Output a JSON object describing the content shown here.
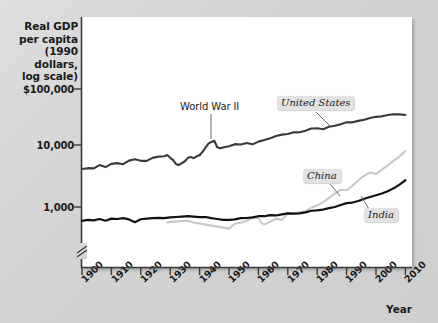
{
  "chart_data": {
    "type": "line",
    "title": "",
    "ylabel": "Real GDP per capita (1990 dollars, log scale)",
    "ylabel_lines": [
      "Real GDP",
      "per capita",
      "(1990 dollars,",
      "log scale)"
    ],
    "xlabel": "Year",
    "log_y": true,
    "grid": false,
    "legend_position": "inline-labels",
    "y_ticks": [
      "$100,000",
      "10,000",
      "1,000"
    ],
    "y_tick_values": [
      100000,
      10000,
      1000
    ],
    "ylim": [
      600,
      300000
    ],
    "xlim": [
      1900,
      2012
    ],
    "x_ticks": [
      "1900",
      "1910",
      "1920",
      "1930",
      "1940",
      "1950",
      "1960",
      "1970",
      "1980",
      "1990",
      "2000",
      "2010"
    ],
    "x_tick_values": [
      1900,
      1910,
      1920,
      1930,
      1940,
      1950,
      1960,
      1970,
      1980,
      1990,
      2000,
      2010
    ],
    "axis_break": true,
    "annotations": [
      {
        "text": "World War II",
        "x": 1944,
        "y": 11500
      }
    ],
    "series": [
      {
        "name": "United States",
        "color": "#3a3a3a",
        "label_x": 1978,
        "label_y": 38000,
        "x": [
          1900,
          1902,
          1904,
          1906,
          1908,
          1910,
          1912,
          1914,
          1916,
          1918,
          1920,
          1922,
          1924,
          1926,
          1928,
          1929,
          1930,
          1931,
          1932,
          1933,
          1934,
          1935,
          1936,
          1937,
          1938,
          1939,
          1940,
          1941,
          1942,
          1943,
          1944,
          1945,
          1946,
          1947,
          1948,
          1950,
          1952,
          1954,
          1956,
          1958,
          1960,
          1962,
          1964,
          1966,
          1968,
          1970,
          1972,
          1974,
          1976,
          1978,
          1980,
          1982,
          1984,
          1986,
          1988,
          1990,
          1992,
          1994,
          1996,
          1998,
          2000,
          2002,
          2004,
          2006,
          2008,
          2010
        ],
        "y": [
          4091,
          4230,
          4200,
          4750,
          4400,
          4964,
          5100,
          4900,
          5600,
          5900,
          5552,
          5540,
          6200,
          6500,
          6569,
          6899,
          6213,
          5691,
          4908,
          4777,
          5114,
          5467,
          6204,
          6430,
          6126,
          6561,
          6838,
          7780,
          9037,
          10500,
          11200,
          11700,
          9197,
          8886,
          9100,
          9561,
          10316,
          10190,
          10760,
          10250,
          11328,
          12000,
          12800,
          14000,
          14700,
          15030,
          16000,
          16100,
          17000,
          18500,
          18577,
          18000,
          19700,
          20400,
          21700,
          23201,
          23200,
          24500,
          25500,
          27300,
          28467,
          29000,
          30500,
          31400,
          31200,
          30491
        ]
      },
      {
        "name": "China",
        "color": "#c8c8c8",
        "label_x": 1973,
        "label_y": 1700,
        "x": [
          1929,
          1931,
          1933,
          1935,
          1936,
          1938,
          1950,
          1952,
          1954,
          1956,
          1958,
          1960,
          1961,
          1962,
          1964,
          1966,
          1968,
          1970,
          1972,
          1974,
          1976,
          1978,
          1980,
          1982,
          1984,
          1986,
          1988,
          1990,
          1992,
          1994,
          1996,
          1998,
          2000,
          2002,
          2004,
          2006,
          2008,
          2010
        ],
        "y": [
          562,
          580,
          590,
          600,
          597,
          562,
          448,
          538,
          557,
          600,
          672,
          662,
          553,
          520,
          580,
          650,
          620,
          783,
          790,
          820,
          853,
          978,
          1061,
          1200,
          1400,
          1650,
          1900,
          1858,
          2200,
          2700,
          3200,
          3600,
          3421,
          4000,
          4700,
          5600,
          6500,
          8032
        ]
      },
      {
        "name": "India",
        "color": "#111111",
        "label_x": 1992,
        "label_y": 1080,
        "x": [
          1900,
          1902,
          1904,
          1906,
          1908,
          1910,
          1912,
          1914,
          1916,
          1918,
          1920,
          1922,
          1924,
          1926,
          1928,
          1930,
          1932,
          1934,
          1936,
          1938,
          1940,
          1942,
          1944,
          1946,
          1948,
          1950,
          1952,
          1954,
          1956,
          1958,
          1960,
          1962,
          1964,
          1966,
          1968,
          1970,
          1972,
          1974,
          1976,
          1978,
          1980,
          1982,
          1984,
          1986,
          1988,
          1990,
          1992,
          1994,
          1996,
          1998,
          2000,
          2002,
          2004,
          2006,
          2008,
          2010
        ],
        "y": [
          599,
          620,
          610,
          640,
          600,
          650,
          640,
          660,
          630,
          570,
          635,
          650,
          660,
          670,
          660,
          680,
          690,
          700,
          710,
          700,
          686,
          690,
          660,
          640,
          618,
          619,
          630,
          660,
          665,
          680,
          710,
          710,
          740,
          730,
          760,
          790,
          780,
          790,
          820,
          870,
          885,
          910,
          960,
          1000,
          1080,
          1155,
          1180,
          1250,
          1360,
          1450,
          1550,
          1650,
          1800,
          2000,
          2300,
          2700
        ]
      }
    ]
  },
  "axes": {
    "y_title_lines": [
      "Real GDP",
      "per capita",
      "(1990 dollars,",
      "log scale)"
    ],
    "y_labels": [
      {
        "text": "$100,000",
        "px_y": 89
      },
      {
        "text": "10,000",
        "px_y": 145
      },
      {
        "text": "1,000",
        "px_y": 207
      }
    ],
    "x_labels": [
      {
        "text": "1900",
        "px_x": 82
      },
      {
        "text": "1910",
        "px_x": 112
      },
      {
        "text": "1920",
        "px_x": 141
      },
      {
        "text": "1930",
        "px_x": 170
      },
      {
        "text": "1940",
        "px_x": 200
      },
      {
        "text": "1950",
        "px_x": 229
      },
      {
        "text": "1960",
        "px_x": 258
      },
      {
        "text": "1970",
        "px_x": 288
      },
      {
        "text": "1980",
        "px_x": 317
      },
      {
        "text": "1990",
        "px_x": 346
      },
      {
        "text": "2000",
        "px_x": 376
      },
      {
        "text": "2010",
        "px_x": 405
      }
    ],
    "x_title": "Year"
  },
  "labels": {
    "united_states": "United States",
    "china": "China",
    "india": "India",
    "world_war_ii": "World War II"
  }
}
